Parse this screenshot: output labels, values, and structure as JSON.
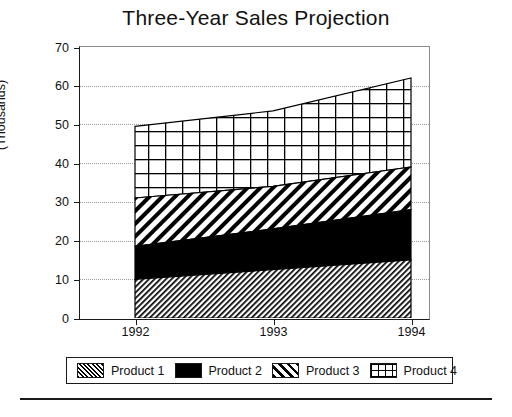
{
  "chart_data": {
    "type": "area",
    "title": "Three-Year Sales Projection",
    "subtitle": "",
    "xlabel": "",
    "ylabel": "(Thousands)",
    "categories": [
      "1992",
      "1993",
      "1994"
    ],
    "x": [
      1992,
      1993,
      1994
    ],
    "stacked": true,
    "series": [
      {
        "name": "Product 1",
        "fill": "dense-diagonal-hatch",
        "values": [
          10,
          12.5,
          15
        ]
      },
      {
        "name": "Product 2",
        "fill": "solid-black",
        "values": [
          8.5,
          10.5,
          13
        ]
      },
      {
        "name": "Product 3",
        "fill": "wide-diagonal-hatch",
        "values": [
          12.5,
          11,
          11
        ]
      },
      {
        "name": "Product 4",
        "fill": "crosshatch-grid",
        "values": [
          18.5,
          19.5,
          23
        ]
      }
    ],
    "cumulative_tops": {
      "Product 1": [
        10,
        12.5,
        15
      ],
      "Product 2": [
        18.5,
        23,
        28
      ],
      "Product 3": [
        31,
        34,
        39
      ],
      "Product 4": [
        49.5,
        53.5,
        62
      ]
    },
    "ylim": [
      0,
      70
    ],
    "yticks": [
      0,
      10,
      20,
      30,
      40,
      50,
      60,
      70
    ],
    "ytick_labels": [
      "0",
      "10",
      "20",
      "30",
      "40",
      "50",
      "60",
      "70"
    ],
    "xticks": [
      1992,
      1993,
      1994
    ],
    "xtick_labels": [
      "1992",
      "1993",
      "1994"
    ],
    "grid": {
      "horizontal": true,
      "vertical": false,
      "style": "dotted"
    },
    "legend": {
      "position": "bottom",
      "bordered": true,
      "entries": [
        {
          "label": "Product 1",
          "pattern": "pat-p1"
        },
        {
          "label": "Product 2",
          "pattern": "pat-p2"
        },
        {
          "label": "Product 3",
          "pattern": "pat-p3"
        },
        {
          "label": "Product 4",
          "pattern": "pat-p4"
        }
      ]
    },
    "colors": {
      "ink": "#000000",
      "grid": "#9a9a9a",
      "axis": "#1a1a1a",
      "background": "#ffffff"
    }
  }
}
